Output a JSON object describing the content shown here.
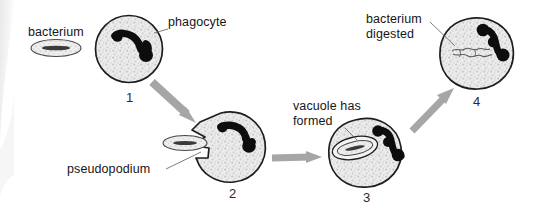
{
  "figure": {
    "background_color": "#ffffff",
    "cytoplasm_fill": "#e8e8e8",
    "outline_color": "#1a1a1a",
    "nucleus_color": "#0d0d0d",
    "arrow_color": "#a6a6a6",
    "leader_line_color": "#6e6e6e",
    "text_color": "#161616"
  },
  "labels": {
    "bacterium": "bacterium",
    "phagocyte": "phagocyte",
    "pseudopodium": "pseudopodium",
    "vacuole_line1": "vacuole has",
    "vacuole_line2": "formed",
    "digested_line1": "bacterium",
    "digested_line2": "digested"
  },
  "steps": [
    {
      "number": "1",
      "name": "phagocyte-approaches-bacterium",
      "shape": "circle",
      "has_vacuole": false,
      "has_pseudopodium": false,
      "bacterium_state": "outside"
    },
    {
      "number": "2",
      "name": "pseudopodium-engulfs-bacterium",
      "shape": "cell-with-pseudopodium",
      "has_vacuole": false,
      "has_pseudopodium": true,
      "bacterium_state": "being-engulfed"
    },
    {
      "number": "3",
      "name": "vacuole-formed",
      "shape": "blob",
      "has_vacuole": true,
      "has_pseudopodium": false,
      "bacterium_state": "inside-vacuole"
    },
    {
      "number": "4",
      "name": "bacterium-digested",
      "shape": "blob",
      "has_vacuole": false,
      "has_pseudopodium": false,
      "bacterium_state": "digested"
    }
  ],
  "arrows": [
    {
      "name": "arrow-step1-to-step2",
      "direction": "down-right"
    },
    {
      "name": "arrow-step2-to-step3",
      "direction": "right"
    },
    {
      "name": "arrow-step3-to-step4",
      "direction": "up-right"
    }
  ]
}
